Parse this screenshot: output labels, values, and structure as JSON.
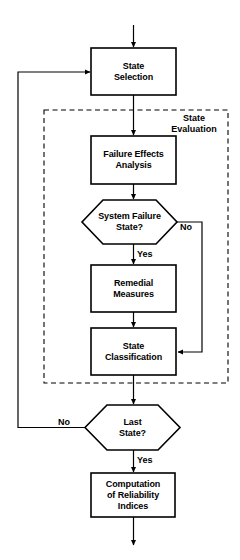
{
  "diagram": {
    "type": "flowchart",
    "title": "",
    "background_color": "#ffffff",
    "line_color": "#000000",
    "text_color": "#000000",
    "nodes": [
      {
        "id": "state-selection",
        "shape": "rectangle",
        "label": "State\nSelection",
        "x": 91,
        "y": 48,
        "w": 85,
        "h": 47
      },
      {
        "id": "failure-effects-analysis",
        "shape": "rectangle",
        "label": "Failure Effects\nAnalysis",
        "x": 91,
        "y": 136,
        "w": 85,
        "h": 48
      },
      {
        "id": "system-failure-state",
        "shape": "hexagon",
        "label": "System Failure\nState?",
        "x": 82,
        "y": 200,
        "w": 95,
        "h": 44
      },
      {
        "id": "remedial-measures",
        "shape": "rectangle",
        "label": "Remedial\nMeasures",
        "x": 91,
        "y": 265,
        "w": 85,
        "h": 47
      },
      {
        "id": "state-classification",
        "shape": "rectangle",
        "label": "State\nClassification",
        "x": 91,
        "y": 328,
        "w": 85,
        "h": 47
      },
      {
        "id": "last-state",
        "shape": "hexagon",
        "label": "Last\nState?",
        "x": 85,
        "y": 405,
        "w": 95,
        "h": 45
      },
      {
        "id": "computation-of-reliability-indices",
        "shape": "rectangle",
        "label": "Computation\nof Reliability\nIndices",
        "x": 91,
        "y": 473,
        "w": 84,
        "h": 44
      }
    ],
    "groups": [
      {
        "id": "state-evaluation",
        "label": "State\nEvaluation",
        "style": "dashed",
        "x": 44,
        "y": 110,
        "w": 184,
        "h": 273,
        "label_x": 163,
        "label_y": 113,
        "label_w": 62
      }
    ],
    "edge_labels": [
      {
        "id": "system-failure-no",
        "text": "No",
        "x": 180,
        "y": 222
      },
      {
        "id": "system-failure-yes",
        "text": "Yes",
        "x": 137,
        "y": 249
      },
      {
        "id": "last-state-no",
        "text": "No",
        "x": 58,
        "y": 417
      },
      {
        "id": "last-state-yes",
        "text": "Yes",
        "x": 137,
        "y": 455
      }
    ],
    "edges": [
      {
        "id": "entry-to-state-selection",
        "from": "entry",
        "to": "state-selection",
        "label": ""
      },
      {
        "id": "state-selection-to-failure-effects",
        "from": "state-selection",
        "to": "failure-effects-analysis",
        "label": ""
      },
      {
        "id": "failure-effects-to-system-failure",
        "from": "failure-effects-analysis",
        "to": "system-failure-state",
        "label": ""
      },
      {
        "id": "system-failure-yes-to-remedial",
        "from": "system-failure-state",
        "to": "remedial-measures",
        "label": "Yes"
      },
      {
        "id": "system-failure-no-to-classification",
        "from": "system-failure-state",
        "to": "state-classification",
        "label": "No"
      },
      {
        "id": "remedial-to-classification",
        "from": "remedial-measures",
        "to": "state-classification",
        "label": ""
      },
      {
        "id": "classification-to-last-state",
        "from": "state-classification",
        "to": "last-state",
        "label": ""
      },
      {
        "id": "last-state-no-to-state-selection",
        "from": "last-state",
        "to": "state-selection",
        "label": "No"
      },
      {
        "id": "last-state-yes-to-computation",
        "from": "last-state",
        "to": "computation-of-reliability-indices",
        "label": "Yes"
      },
      {
        "id": "computation-to-exit",
        "from": "computation-of-reliability-indices",
        "to": "exit",
        "label": ""
      }
    ]
  }
}
